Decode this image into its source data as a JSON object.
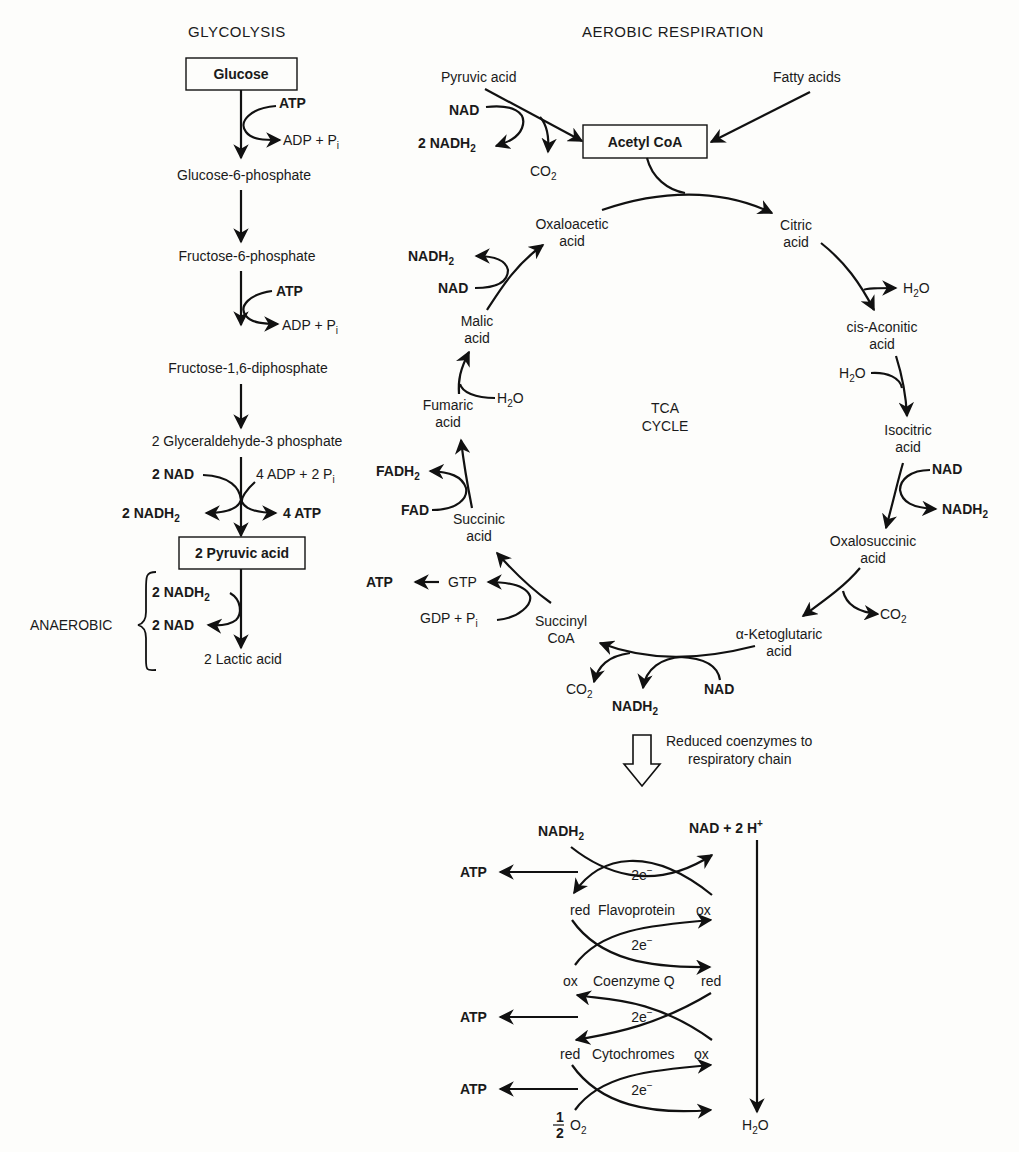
{
  "headings": {
    "glycolysis": "GLYCOLYSIS",
    "aerobic": "AEROBIC RESPIRATION",
    "anaerobic": "ANAEROBIC",
    "tca_line1": "TCA",
    "tca_line2": "CYCLE"
  },
  "glycolysis": {
    "glucose": "Glucose",
    "atp1": "ATP",
    "adp1": "ADP + P",
    "g6p": "Glucose-6-phosphate",
    "f6p": "Fructose-6-phosphate",
    "atp2": "ATP",
    "adp2": "ADP + P",
    "f16dp": "Fructose-1,6-diphosphate",
    "g3p": "2 Glyceraldehyde-3 phosphate",
    "nad2": "2 NAD",
    "adp4": "4 ADP + 2 P",
    "nadh2_2": "2 NADH",
    "atp4": "4 ATP",
    "pyruvic2": "2 Pyruvic acid",
    "an_nadh2": "2 NADH",
    "an_nad": "2 NAD",
    "lactic": "2 Lactic acid",
    "sub_i": "i",
    "sub_2": "2"
  },
  "entry": {
    "pyruvic": "Pyruvic acid",
    "fatty": "Fatty acids",
    "nad": "NAD",
    "nadh2": "2 NADH",
    "co2": "CO",
    "acetyl": "Acetyl CoA"
  },
  "tca": {
    "oxaloacetic": [
      "Oxaloacetic",
      "acid"
    ],
    "citric": [
      "Citric",
      "acid"
    ],
    "h2o_out": "H",
    "cis_aconitic": [
      "cis-Aconitic",
      "acid"
    ],
    "h2o_in": "H",
    "isocitric": [
      "Isocitric",
      "acid"
    ],
    "iso_nad": "NAD",
    "iso_nadh2": "NADH",
    "oxalosuccinic": [
      "Oxalosuccinic",
      "acid"
    ],
    "oxs_co2": "CO",
    "ketoglutaric": [
      "α-Ketoglutaric",
      "acid"
    ],
    "kg_nad": "NAD",
    "kg_nadh2": "NADH",
    "kg_co2": "CO",
    "succinyl": [
      "Succinyl",
      "CoA"
    ],
    "gdp": "GDP + P",
    "gtp": "GTP",
    "atp": "ATP",
    "succinic": [
      "Succinic",
      "acid"
    ],
    "fad": "FAD",
    "fadh2": "FADH",
    "fumaric": [
      "Fumaric",
      "acid"
    ],
    "fum_h2o": "H",
    "malic": [
      "Malic",
      "acid"
    ],
    "mal_nad": "NAD",
    "mal_nadh2": "NADH"
  },
  "chain": {
    "caption": [
      "Reduced coenzymes to",
      "respiratory chain"
    ],
    "nadh2": "NADH",
    "nad_h": "NAD + 2 H",
    "electrons": "2e",
    "atp": "ATP",
    "flavo": {
      "left": "red",
      "name": "Flavoprotein",
      "right": "ox"
    },
    "coq": {
      "left": "ox",
      "name": "Coenzyme Q",
      "right": "red"
    },
    "cyto": {
      "left": "red",
      "name": "Cytochromes",
      "right": "ox"
    },
    "half": "1",
    "half_den": "2",
    "o2": "O",
    "h2o": "H"
  }
}
